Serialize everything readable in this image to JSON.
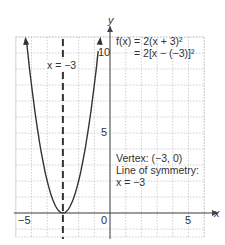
{
  "chart_data": {
    "type": "line",
    "title": "",
    "function_label_line1": "f(x) = 2(x + 3)²",
    "function_label_line2": "= 2[x − (−3)]²",
    "xlabel": "x",
    "ylabel": "y",
    "xlim": [
      -6,
      6
    ],
    "ylim": [
      -1.5,
      11
    ],
    "grid": true,
    "x_ticks": [
      {
        "value": -5,
        "label": "−5"
      },
      {
        "value": 0,
        "label": "0"
      },
      {
        "value": 5,
        "label": "5"
      }
    ],
    "y_ticks": [
      {
        "value": 5,
        "label": "5"
      },
      {
        "value": 10,
        "label": "10"
      }
    ],
    "series": [
      {
        "name": "f(x) = 2(x + 3)^2",
        "style": "solid",
        "x": [
          -5.35,
          -5,
          -4.5,
          -4,
          -3.5,
          -3,
          -2.5,
          -2,
          -1.5,
          -0.65
        ],
        "y": [
          11,
          8,
          4.5,
          2,
          0.5,
          0,
          0.5,
          2,
          4.5,
          11
        ]
      }
    ],
    "symmetry_line": {
      "x": -3,
      "style": "dashed",
      "label": "x = −3"
    },
    "annotations": {
      "vertex": "Vertex: (−3, 0)",
      "symmetry_title": "Line of symmetry:",
      "symmetry_eq": "x = −3"
    },
    "colors": {
      "curve": "#333333",
      "grid": "#bdbdbd",
      "axis": "#444444"
    }
  }
}
